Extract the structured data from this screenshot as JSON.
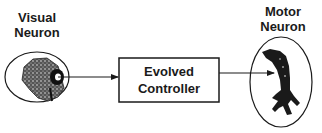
{
  "diagram": {
    "nodes": [
      {
        "id": "visual",
        "label_line1": "Visual",
        "label_line2": "Neuron",
        "shape": "ellipse",
        "icon": "visual-neuron-cell-icon"
      },
      {
        "id": "controller",
        "label_line1": "Evolved",
        "label_line2": "Controller",
        "shape": "rectangle"
      },
      {
        "id": "motor",
        "label_line1": "Motor",
        "label_line2": "Neuron",
        "shape": "ellipse",
        "icon": "motor-neuron-cell-icon"
      }
    ],
    "edges": [
      {
        "from": "visual",
        "to": "controller",
        "arrow": "right"
      },
      {
        "from": "controller",
        "to": "motor",
        "arrow": "right"
      }
    ],
    "colors": {
      "stroke": "#1a1a1a",
      "background": "#ffffff"
    }
  }
}
